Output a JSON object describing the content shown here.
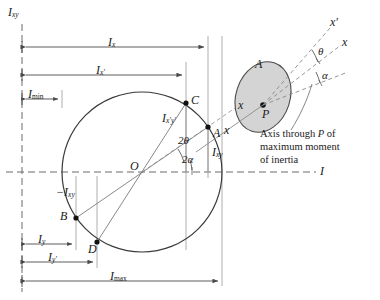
{
  "figure": {
    "type": "mohrs-circle-moments-of-inertia",
    "axes": {
      "vertical_label": "I",
      "vertical_sub": "xy",
      "horizontal_label": "I"
    },
    "points": [
      {
        "name": "A",
        "label": "A",
        "x": 208,
        "y": 127
      },
      {
        "name": "B",
        "label": "B",
        "x": 76,
        "y": 218
      },
      {
        "name": "C",
        "label": "C",
        "x": 186,
        "y": 103
      },
      {
        "name": "D",
        "label": "D",
        "x": 97,
        "y": 242
      },
      {
        "name": "O",
        "label": "O",
        "x": 142,
        "y": 172
      },
      {
        "name": "P",
        "label": "P",
        "x": 263,
        "y": 105
      }
    ],
    "circle": {
      "cx": 142,
      "cy": 172,
      "r": 80
    },
    "angles": [
      {
        "label": "2",
        "symbol": "θ",
        "full": "2θ"
      },
      {
        "label": "2",
        "symbol": "α",
        "full": "2α"
      },
      {
        "symbol": "θ",
        "full": "θ"
      },
      {
        "symbol": "α",
        "full": "α"
      }
    ],
    "dimensions": [
      {
        "name": "Ix",
        "base": "I",
        "sub": "x",
        "sub_roman": false,
        "from": 22,
        "to": 208,
        "y": 47
      },
      {
        "name": "Ixp",
        "base": "I",
        "sub": "x′",
        "sub_roman": false,
        "from": 22,
        "to": 186,
        "y": 75
      },
      {
        "name": "Imin",
        "base": "I",
        "sub": "min",
        "sub_roman": true,
        "from": 22,
        "to": 62,
        "y": 99
      },
      {
        "name": "Iy",
        "base": "I",
        "sub": "y",
        "sub_roman": false,
        "from": 22,
        "to": 76,
        "y": 244
      },
      {
        "name": "Iyp",
        "base": "I",
        "sub": "y′",
        "sub_roman": false,
        "from": 22,
        "to": 97,
        "y": 262
      },
      {
        "name": "Imax",
        "base": "I",
        "sub": "max",
        "sub_roman": true,
        "from": 22,
        "to": 222,
        "y": 281
      }
    ],
    "segment_labels": [
      {
        "name": "Ixpyp",
        "base": "I",
        "sub": "x′y′",
        "x": 172,
        "y": 112
      },
      {
        "name": "Ixy",
        "base": "I",
        "sub": "xy",
        "x": 212,
        "y": 152
      },
      {
        "name": "negIxy",
        "base": "−I",
        "sub": "xy",
        "x": 68,
        "y": 194
      }
    ],
    "body": {
      "area_label": "A",
      "point_label": "P",
      "axis_x_label": "x",
      "axis_xprime_label": "x′",
      "inner_x_label": "x",
      "note_line1": "Axis through P of",
      "note_line2": "maximum moment",
      "note_line3": "of inertia"
    },
    "mohr_axis_x_label": "x",
    "colors": {
      "line": "#4a4a4a",
      "circle": "#3a3a3a",
      "dashed": "#6a6a6a",
      "body_fill": "#d4d4d4",
      "body_stroke": "#4a4a4a",
      "text": "#1a1a1a"
    }
  }
}
